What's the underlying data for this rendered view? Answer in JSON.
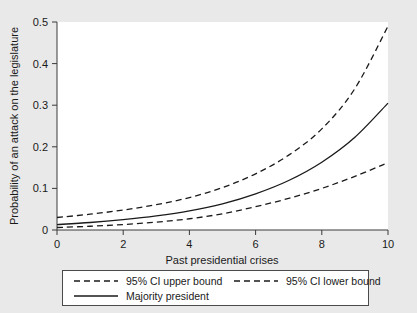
{
  "chart_data": {
    "type": "line",
    "title": "",
    "xlabel": "Past presidential crises",
    "ylabel": "Probability of an attack on the legislature",
    "xlim": [
      0,
      10
    ],
    "ylim": [
      0,
      0.5
    ],
    "xticks": [
      "0",
      "2",
      "4",
      "6",
      "8",
      "10"
    ],
    "xtick_values": [
      0,
      2,
      4,
      6,
      8,
      10
    ],
    "yticks": [
      "0",
      "0.1",
      "0.2",
      "0.3",
      "0.4",
      "0.5"
    ],
    "ytick_values": [
      0,
      0.1,
      0.2,
      0.3,
      0.4,
      0.5
    ],
    "grid": false,
    "legend_position": "below-plot",
    "x": [
      0,
      1,
      2,
      3,
      4,
      5,
      6,
      7,
      8,
      9,
      10
    ],
    "series": [
      {
        "name": "95% CI upper bound",
        "style": "dashed",
        "color": "#1a1a1a",
        "values": [
          0.03,
          0.038,
          0.048,
          0.061,
          0.078,
          0.102,
          0.135,
          0.18,
          0.243,
          0.34,
          0.49
        ]
      },
      {
        "name": "Majority president",
        "style": "solid",
        "color": "#1a1a1a",
        "values": [
          0.013,
          0.018,
          0.025,
          0.034,
          0.046,
          0.063,
          0.087,
          0.119,
          0.163,
          0.223,
          0.305
        ]
      },
      {
        "name": "95% CI lower bound",
        "style": "dashed",
        "color": "#1a1a1a",
        "values": [
          0.006,
          0.009,
          0.013,
          0.019,
          0.027,
          0.039,
          0.056,
          0.076,
          0.1,
          0.129,
          0.162
        ]
      }
    ]
  },
  "legend": {
    "entries": [
      {
        "label": "95% CI upper bound",
        "style": "dashed"
      },
      {
        "label": "95% CI lower bound",
        "style": "dashed"
      },
      {
        "label": "Majority president",
        "style": "solid"
      }
    ]
  },
  "colors": {
    "background": "#e9e9e9",
    "plot_background": "#ffffff",
    "line": "#1a1a1a",
    "axis": "#3a3a3a"
  }
}
